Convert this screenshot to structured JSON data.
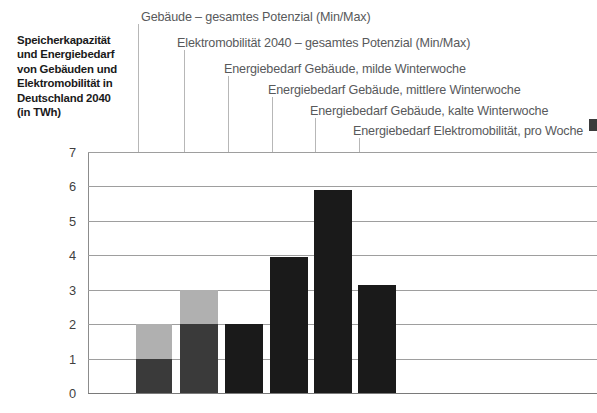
{
  "title": {
    "lines": [
      "Speicherkapazität",
      "und Energiebedarf",
      "von Gebäuden und",
      "Elektromobilität in",
      "Deutschland 2040",
      "(in TWh)"
    ]
  },
  "colors": {
    "bar_dark": "#3a3a3a",
    "bar_black": "#1a1a1a",
    "bar_light": "#b0b0b0",
    "gridline": "#9e9e9e",
    "leader": "#b7b7b7",
    "label_text": "#58595b",
    "title_text": "#1a1a1a"
  },
  "chart_data": {
    "type": "bar",
    "title": "Speicherkapazität und Energiebedarf von Gebäuden und Elektromobilität in Deutschland 2040 (in TWh)",
    "xlabel": "",
    "ylabel": "",
    "ylim": [
      0,
      7
    ],
    "yticks": [
      "0",
      "1",
      "2",
      "3",
      "4",
      "5",
      "6",
      "7"
    ],
    "grid": true,
    "legend": "callout-labels-above",
    "unit": "TWh",
    "categories": [
      "Gebäude – gesamtes Potenzial (Min/Max)",
      "Elektromobilität 2040 – gesamtes Potenzial (Min/Max)",
      "Energiebedarf Gebäude, milde Winterwoche",
      "Energiebedarf Gebäude, mittlere Winterwoche",
      "Energiebedarf Gebäude, kalte Winterwoche",
      "Energiebedarf Elektromobilität, pro Woche"
    ],
    "bars": [
      {
        "label": "Gebäude – gesamtes Potenzial (Min/Max)",
        "min": 1.0,
        "max": 2.0,
        "stacked": true,
        "value": 2.0,
        "style": "dark-light"
      },
      {
        "label": "Elektromobilität 2040 – gesamtes Potenzial (Min/Max)",
        "min": 2.0,
        "max": 3.0,
        "stacked": true,
        "value": 3.0,
        "style": "dark-light"
      },
      {
        "label": "Energiebedarf Gebäude, milde Winterwoche",
        "min": null,
        "max": null,
        "stacked": false,
        "value": 2.0,
        "style": "black"
      },
      {
        "label": "Energiebedarf Gebäude, mittlere Winterwoche",
        "min": null,
        "max": null,
        "stacked": false,
        "value": 3.95,
        "style": "black"
      },
      {
        "label": "Energiebedarf Gebäude, kalte Winterwoche",
        "min": null,
        "max": null,
        "stacked": false,
        "value": 5.9,
        "style": "black"
      },
      {
        "label": "Energiebedarf Elektromobilität, pro Woche",
        "min": null,
        "max": null,
        "stacked": false,
        "value": 3.15,
        "style": "black"
      }
    ],
    "values": [
      2.0,
      3.0,
      2.0,
      3.95,
      5.9,
      3.15
    ]
  }
}
